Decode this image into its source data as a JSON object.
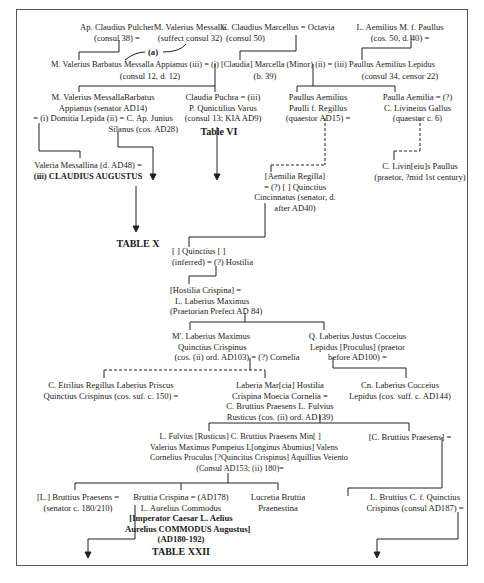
{
  "diagram": {
    "type": "genealogical-stemma",
    "nodes": {
      "ap_claudius": [
        "Ap. Claudius Pulcher",
        "(consul 38) ="
      ],
      "m_val_messalla": [
        "M. Valerius Messalla",
        "(suffect consul 32)"
      ],
      "c_marcellus": [
        "C. Claudius Marcellus = Octavia",
        "(consul 50)"
      ],
      "l_aemilius": [
        "L. Aemilius M. f. Paullus",
        "(cos. 50, d. 40) ="
      ],
      "barbatus_line1": "M. Valerius Barbatus Messalla Appianus (iii) = (i) [Claudia] Marcella (Minor) (ii) = (iii) Paullus Aemilius Lepidus",
      "barbatus_sub": "(consul 12, d. 12)",
      "marcella_sub": "(b. 39)",
      "lepidus_sub": "(consul 34, censor 22)",
      "messalla_barbatus": [
        "M. Valerius MessallaBarbatus",
        "Appianus (senator AD14)",
        "= (i) Domitia Lepida (ii) = C. Ap. Junius",
        "Silanus (cos. AD28)"
      ],
      "claudia_pulchra": [
        "Claudia Puchra = (iii)",
        "P. Qunictilius Varus",
        "(consul 13; KIA AD9)"
      ],
      "paullus_regillus": [
        "Paullus Aemilius",
        "Paulli f. Regillus",
        "(quaestor AD15) ="
      ],
      "paulla_aemilia": [
        "Paulla Aemilia = (?)",
        "C. Livineius Gallus",
        "(quaestor c. 6)"
      ],
      "valeria_messallina": [
        "Valeria Messallina (d. AD48) =",
        "(iii) CLAUDIUS AUGUSTUS"
      ],
      "aemilia_regilla": [
        "[Aemilia Regilla]",
        "= (?) [  ] Quinctius",
        "Cincinnatus (senator, d.",
        "after AD40)"
      ],
      "livineius_paullus": [
        "C. Livin[eiu]s Paullus",
        "(praetor, ?mid 1st century)"
      ],
      "quinctius_inferred": [
        "[  ] Quinctius [          ]",
        "(inferred) = (?) Hostilia"
      ],
      "hostilia_crispina": [
        "[Hostilia   Crispina] =",
        "L. Laberius Maximus",
        "(Praetorian Prefect AD 84)"
      ],
      "m_laberius": [
        "M'. Laberius Maximus",
        "Quinctius Crispinus",
        "(cos. (ii) ord. AD103) = (?) Cornelia"
      ],
      "q_laberius": [
        "Q. Laberius Justus Cocceius",
        "Lepidus [Proculus] (praetor",
        "before AD100) ="
      ],
      "c_etrilius": [
        "C. Etrilius Regillus Laberius Priscus",
        "Quinctius Crispinus (cos. suf. c. 150) ="
      ],
      "laberia_marcia": [
        "Laberia Mar[cia] Hostilia",
        "Crispina Moecia Cornelia =",
        "C. Bruttius Praesens L. Fulvius",
        "Rusticus (cos. (ii) ord. AD139)"
      ],
      "cn_laberius": [
        "Cn. Laberius Cocceius",
        "Lepidus (cos. suff. c. AD144)"
      ],
      "l_fulvius": [
        "L. Fulvius [Rusticus] C. Bruttius Praesens Min[          ]",
        "Valerius Maximus Pompeius L[onginus Abumius] Valens",
        "Cornelius Proculus [?Quincitus Crispinus] Aquillius Veiento",
        "(Consul AD153; (ii) 180)="
      ],
      "c_bruttius": [
        "[C. Bruttius Praesens] ="
      ],
      "l_bruttius_praesens": [
        "[L.] Bruttius Praesens =",
        "(senator c. 180/210)"
      ],
      "bruttia_crispina": [
        "Bruttia Crispina = (AD178)",
        "L. Aurelius Commodus",
        "[Imperator Caesar L. Aelius",
        "Aurelius COMMODUS Augustus]",
        "(AD180-192)"
      ],
      "lucretia": [
        "Lucretia Bruttia",
        "Praenestina"
      ],
      "l_bruttius_quinctius": [
        "L. Bruttius C. f. Quinctius",
        "Crispinus (consul AD187) ="
      ]
    },
    "labels": {
      "link_a": "(a)",
      "table_vi": "Table VI",
      "table_x": "TABLE X",
      "table_xxii": "TABLE XXII"
    }
  }
}
